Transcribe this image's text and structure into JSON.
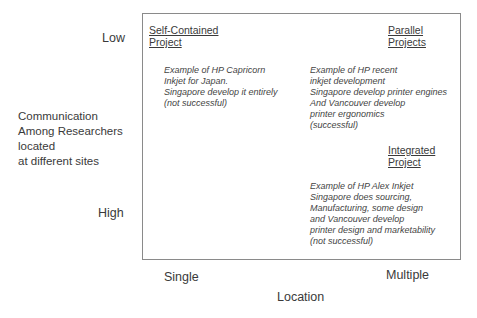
{
  "y_axis": {
    "low_label": "Low",
    "high_label": "High",
    "title_lines": [
      "Communication",
      "Among Researchers",
      "located",
      "at different sites"
    ]
  },
  "x_axis": {
    "left_label": "Single",
    "right_label": "Multiple",
    "title": "Location"
  },
  "quadrants": {
    "self_contained": {
      "title_lines": [
        "Self-Contained",
        "Project"
      ],
      "desc_lines": [
        "Example of HP Capricorn",
        "Inkjet for Japan.",
        "Singapore develop it entirely",
        "(not successful)"
      ]
    },
    "parallel": {
      "title_lines": [
        "Parallel",
        "Projects"
      ],
      "desc_lines": [
        "Example of HP recent",
        "inkjet development",
        "Singapore develop printer engines",
        "And Vancouver develop",
        "printer ergonomics",
        "(successful)"
      ]
    },
    "integrated": {
      "title_lines": [
        "Integrated",
        "Project"
      ],
      "desc_lines": [
        "Example of HP Alex Inkjet",
        "Singapore does sourcing,",
        "Manufacturing, some design",
        "and Vancouver develop",
        "printer design and marketability",
        "(not successful)"
      ]
    }
  }
}
